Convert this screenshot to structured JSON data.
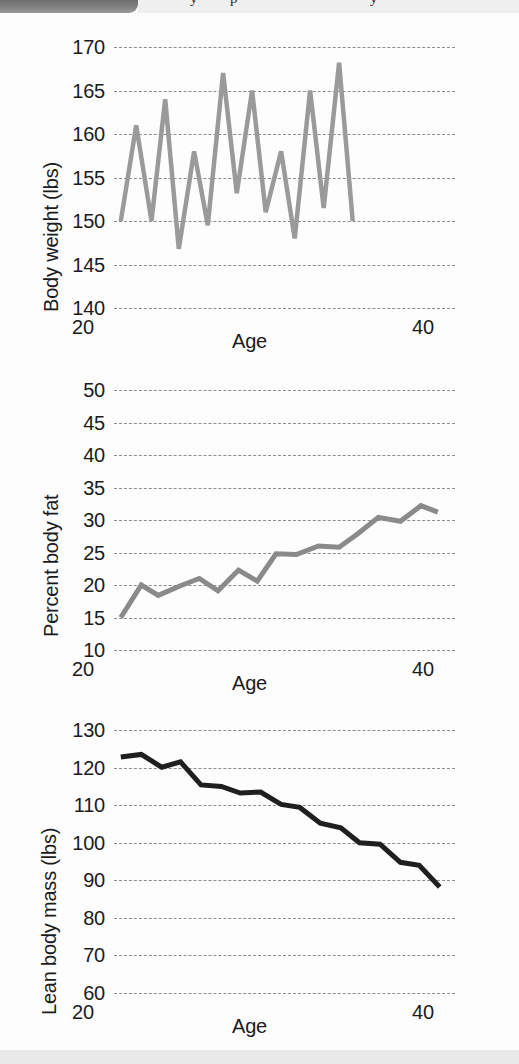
{
  "header": {
    "tab_color": "#7b7b7b",
    "strip_color": "#efefef",
    "glyph_1": "y",
    "glyph_2": "p",
    "glyph_3": "y"
  },
  "footer": {
    "band_color": "#e9e9e9"
  },
  "axis_common": {
    "xlabel": "Age",
    "x_tick_min": "20",
    "x_tick_max": "40"
  },
  "chart_data": [
    {
      "id": "body-weight",
      "type": "line",
      "title": "",
      "xlabel": "Age",
      "ylabel": "Body weight (lbs)",
      "xlim": [
        20,
        40
      ],
      "ylim": [
        140,
        170
      ],
      "yticks": [
        170,
        165,
        160,
        155,
        150,
        145,
        140
      ],
      "xticks": [
        20,
        40
      ],
      "grid": true,
      "legend": "none",
      "line_color": "#9a9a9a",
      "line_width": 4.5,
      "x": [
        20.4,
        21.0,
        21.6,
        22.2,
        22.8,
        23.4,
        24.1,
        24.7,
        25.3,
        25.9,
        26.5,
        27.2,
        27.8,
        28.4,
        29.0,
        29.6,
        30.3,
        30.9,
        31.5,
        32.1,
        32.7,
        33.4,
        34.0,
        34.6,
        35.2,
        35.8,
        36.5,
        37.1,
        37.7,
        38.3,
        38.9,
        39.5
      ],
      "values": [
        150.0,
        161.0,
        150.0,
        164.0,
        147.0,
        158.0,
        149.5,
        167.0,
        153.0,
        165.0,
        151.0,
        158.0,
        148.0,
        165.0,
        151.5,
        168.0,
        150.0,
        168.0,
        150.0,
        165.0,
        151.5,
        158.0,
        148.0,
        165.0,
        151.0,
        167.0,
        153.0,
        158.0,
        149.5,
        164.0,
        147.0,
        150.0
      ],
      "vertices": [
        [
          20.4,
          150.0
        ],
        [
          21.3,
          161.0
        ],
        [
          22.2,
          150.0
        ],
        [
          23.0,
          164.0
        ],
        [
          23.8,
          146.8
        ],
        [
          24.7,
          158.0
        ],
        [
          25.5,
          149.5
        ],
        [
          26.4,
          167.0
        ],
        [
          27.2,
          153.2
        ],
        [
          28.1,
          165.0
        ],
        [
          28.9,
          151.0
        ],
        [
          29.8,
          158.0
        ],
        [
          30.6,
          148.0
        ],
        [
          31.5,
          165.0
        ],
        [
          32.3,
          151.5
        ],
        [
          33.2,
          168.2
        ],
        [
          34.0,
          150.0
        ]
      ]
    },
    {
      "id": "percent-body-fat",
      "type": "line",
      "title": "",
      "xlabel": "Age",
      "ylabel": "Percent body fat",
      "xlim": [
        20,
        40
      ],
      "ylim": [
        10,
        50
      ],
      "yticks": [
        50,
        45,
        40,
        35,
        30,
        25,
        20,
        15,
        10
      ],
      "xticks": [
        20,
        40
      ],
      "grid": true,
      "legend": "none",
      "line_color": "#8a8a8a",
      "line_width": 5,
      "vertices": [
        [
          20.4,
          15.0
        ],
        [
          21.6,
          20.0
        ],
        [
          22.6,
          18.4
        ],
        [
          23.9,
          19.9
        ],
        [
          25.0,
          21.0
        ],
        [
          26.1,
          19.1
        ],
        [
          27.3,
          22.3
        ],
        [
          28.4,
          20.6
        ],
        [
          29.5,
          24.8
        ],
        [
          30.7,
          24.7
        ],
        [
          32.0,
          26.0
        ],
        [
          33.2,
          25.8
        ],
        [
          34.3,
          27.9
        ],
        [
          35.5,
          30.4
        ],
        [
          36.8,
          29.8
        ],
        [
          38.0,
          32.2
        ],
        [
          39.0,
          31.2
        ]
      ]
    },
    {
      "id": "lean-body-mass",
      "type": "line",
      "title": "",
      "xlabel": "Age",
      "ylabel": "Lean body mass (lbs)",
      "xlim": [
        20,
        40
      ],
      "ylim": [
        60,
        130
      ],
      "yticks": [
        130,
        120,
        110,
        100,
        90,
        80,
        70,
        60
      ],
      "xticks": [
        20,
        40
      ],
      "grid": true,
      "legend": "none",
      "line_color": "#1f1f1f",
      "line_width": 5,
      "vertices": [
        [
          20.4,
          122.8
        ],
        [
          21.6,
          123.5
        ],
        [
          22.8,
          120.1
        ],
        [
          23.9,
          121.5
        ],
        [
          25.1,
          115.4
        ],
        [
          26.3,
          115.0
        ],
        [
          27.4,
          113.2
        ],
        [
          28.6,
          113.5
        ],
        [
          29.8,
          110.2
        ],
        [
          30.9,
          109.4
        ],
        [
          32.1,
          105.2
        ],
        [
          33.3,
          104.0
        ],
        [
          34.4,
          100.0
        ],
        [
          35.6,
          99.6
        ],
        [
          36.8,
          94.8
        ],
        [
          37.9,
          94.0
        ],
        [
          39.1,
          88.2
        ]
      ]
    }
  ]
}
